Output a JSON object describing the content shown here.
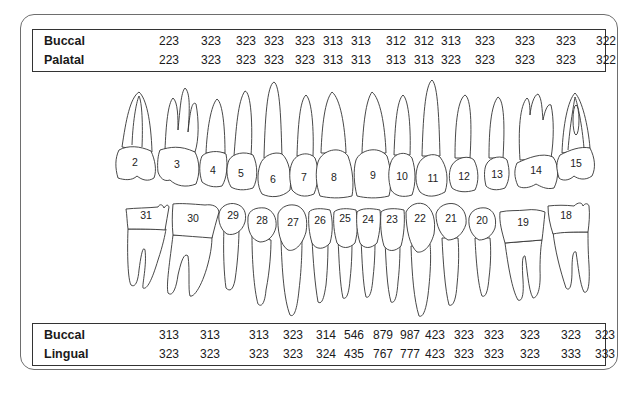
{
  "upper_table": {
    "rows": [
      {
        "label": "Buccal",
        "values": [
          "223",
          "323",
          "323",
          "323",
          "323",
          "313",
          "313",
          "312",
          "312",
          "313",
          "323",
          "323",
          "323",
          "322"
        ]
      },
      {
        "label": "Palatal",
        "values": [
          "223",
          "323",
          "323",
          "323",
          "323",
          "313",
          "313",
          "313",
          "313",
          "323",
          "323",
          "323",
          "323",
          "322"
        ]
      }
    ]
  },
  "upper_teeth": {
    "numbers": [
      "2",
      "3",
      "4",
      "5",
      "6",
      "7",
      "8",
      "9",
      "10",
      "11",
      "12",
      "13",
      "14",
      "15"
    ]
  },
  "lower_teeth": {
    "numbers": [
      "31",
      "30",
      "29",
      "28",
      "27",
      "26",
      "25",
      "24",
      "23",
      "22",
      "21",
      "20",
      "19",
      "18"
    ]
  },
  "lower_table": {
    "rows": [
      {
        "label": "Buccal",
        "values": [
          "313",
          "313",
          "313",
          "323",
          "314",
          "546",
          "879",
          "987",
          "423",
          "323",
          "323",
          "323",
          "323",
          "323"
        ]
      },
      {
        "label": "Lingual",
        "values": [
          "323",
          "323",
          "323",
          "323",
          "324",
          "435",
          "767",
          "777",
          "423",
          "323",
          "323",
          "323",
          "333",
          "333"
        ]
      }
    ]
  }
}
